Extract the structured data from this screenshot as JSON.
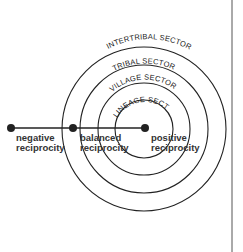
{
  "diagram": {
    "type": "concentric-sectors",
    "colors": {
      "line": "#222222",
      "text": "#333333",
      "background": "#ffffff",
      "border": "#555555"
    },
    "center": {
      "x": 144,
      "y": 129
    },
    "sectors": [
      {
        "label": "LINEAGE SECTOR",
        "radius": 29
      },
      {
        "label": "VILLAGE SECTOR",
        "radius": 46
      },
      {
        "label": "TRIBAL SECTOR",
        "radius": 64
      },
      {
        "label": "INTERTRIBAL SECTOR",
        "radius": 82
      }
    ],
    "axis_points": [
      {
        "line1": "negative",
        "line2": "reciprocity",
        "x": 11
      },
      {
        "line1": "balanced",
        "line2": "reciprocity",
        "x": 73
      },
      {
        "line1": "positive",
        "line2": "reciprocity",
        "x": 144
      }
    ]
  }
}
